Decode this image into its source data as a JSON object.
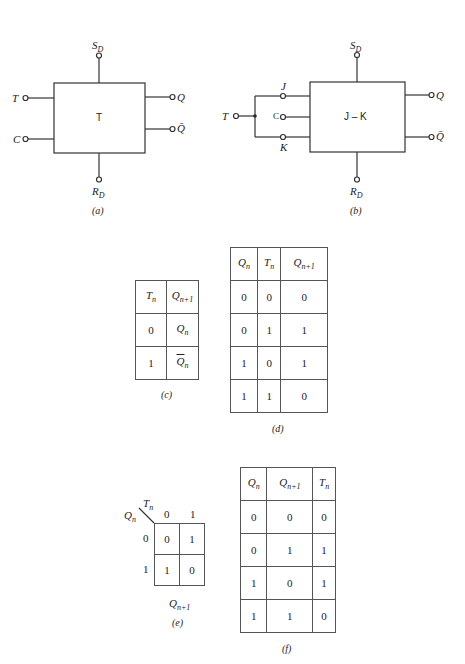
{
  "figure_a": {
    "block_label": "T",
    "inputs": [
      "T",
      "C"
    ],
    "outputs": [
      "Q",
      "Q̄"
    ],
    "set": {
      "base": "S",
      "sub": "D"
    },
    "reset": {
      "base": "R",
      "sub": "D"
    },
    "caption": "(a)"
  },
  "figure_b": {
    "block_label": "J – K",
    "input": "T",
    "pins": [
      "J",
      "C",
      "K"
    ],
    "outputs": [
      "Q",
      "Q̄"
    ],
    "set": {
      "base": "S",
      "sub": "D"
    },
    "reset": {
      "base": "R",
      "sub": "D"
    },
    "caption": "(b)"
  },
  "table_c": {
    "headers": [
      {
        "base": "T",
        "sub": "n"
      },
      {
        "base": "Q",
        "sub": "n+1"
      }
    ],
    "rows": [
      {
        "t": "0",
        "q": "Q",
        "q_sub": "n",
        "complement": false
      },
      {
        "t": "1",
        "q": "Q",
        "q_sub": "n",
        "complement": true
      }
    ],
    "caption": "(c)"
  },
  "table_d": {
    "headers": [
      {
        "base": "Q",
        "sub": "n"
      },
      {
        "base": "T",
        "sub": "n"
      },
      {
        "base": "Q",
        "sub": "n+1"
      }
    ],
    "rows": [
      [
        "0",
        "0",
        "0"
      ],
      [
        "0",
        "1",
        "1"
      ],
      [
        "1",
        "0",
        "1"
      ],
      [
        "1",
        "1",
        "0"
      ]
    ],
    "caption": "(d)"
  },
  "kmap_e": {
    "row_var": {
      "base": "Q",
      "sub": "n"
    },
    "col_var": {
      "base": "T",
      "sub": "n"
    },
    "col_headers": [
      "0",
      "1"
    ],
    "row_headers": [
      "0",
      "1"
    ],
    "cells": [
      [
        "0",
        "1"
      ],
      [
        "1",
        "0"
      ]
    ],
    "output": {
      "base": "Q",
      "sub": "n+1"
    },
    "caption": "(e)"
  },
  "table_f": {
    "headers": [
      {
        "base": "Q",
        "sub": "n"
      },
      {
        "base": "Q",
        "sub": "n+1"
      },
      {
        "base": "T",
        "sub": "n"
      }
    ],
    "rows": [
      [
        "0",
        "0",
        "0"
      ],
      [
        "0",
        "1",
        "1"
      ],
      [
        "1",
        "0",
        "1"
      ],
      [
        "1",
        "1",
        "0"
      ]
    ],
    "caption": "(f)"
  }
}
